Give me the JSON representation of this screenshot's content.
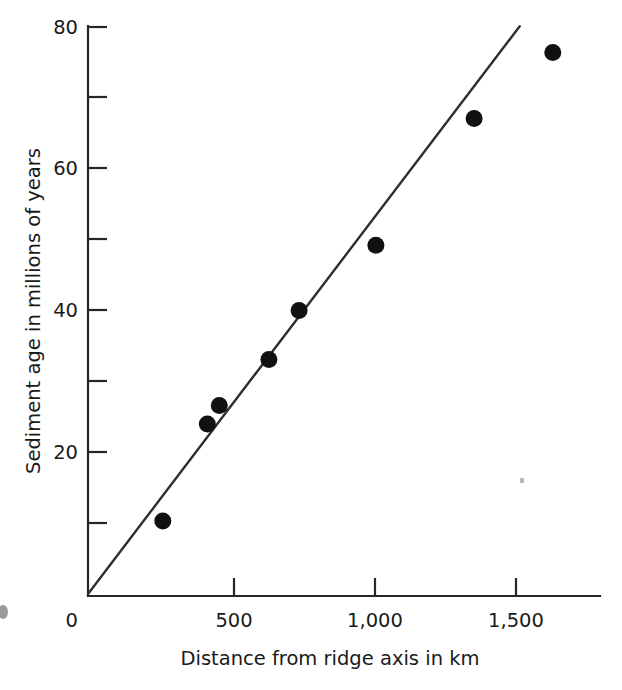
{
  "chart_data": {
    "type": "scatter",
    "title": "",
    "xlabel": "Distance from ridge axis in km",
    "ylabel": "Sediment age in millions of years",
    "xlim": [
      0,
      1900
    ],
    "ylim": [
      0,
      80
    ],
    "grid": false,
    "legend": "none",
    "x_ticks": [
      {
        "value": 0,
        "label": "0",
        "type": "major"
      },
      {
        "value": 500,
        "label": "500",
        "type": "major"
      },
      {
        "value": 1000,
        "label": "1,000",
        "type": "major"
      },
      {
        "value": 1500,
        "label": "1,500",
        "type": "major"
      }
    ],
    "y_ticks": [
      {
        "value": 0,
        "label": "0",
        "type": "major"
      },
      {
        "value": 10,
        "label": "",
        "type": "minor"
      },
      {
        "value": 20,
        "label": "20",
        "type": "major"
      },
      {
        "value": 30,
        "label": "",
        "type": "minor"
      },
      {
        "value": 40,
        "label": "40",
        "type": "major"
      },
      {
        "value": 50,
        "label": "",
        "type": "minor"
      },
      {
        "value": 60,
        "label": "60",
        "type": "major"
      },
      {
        "value": 70,
        "label": "",
        "type": "minor"
      },
      {
        "value": 80,
        "label": "80",
        "type": "major"
      }
    ],
    "series": [
      {
        "name": "Sediment age samples",
        "marker": "filled-circle",
        "color": "#111111",
        "points": [
          {
            "x": 262,
            "y": 10.3
          },
          {
            "x": 418,
            "y": 24.0
          },
          {
            "x": 460,
            "y": 26.6
          },
          {
            "x": 634,
            "y": 33.1
          },
          {
            "x": 740,
            "y": 40.0
          },
          {
            "x": 1009,
            "y": 49.2
          },
          {
            "x": 1353,
            "y": 67.1
          },
          {
            "x": 1629,
            "y": 76.4
          }
        ]
      }
    ],
    "trendline": {
      "name": "Linear fit through origin",
      "color": "#2e2e2e",
      "x_start": 0,
      "y_start": 0,
      "x_end": 1513,
      "y_end": 80.1,
      "slope_per_km": 0.0529
    }
  },
  "annotations": {
    "speck_right_label": "page-artifact-speck",
    "speck_left_label": "page-artifact-mark"
  }
}
